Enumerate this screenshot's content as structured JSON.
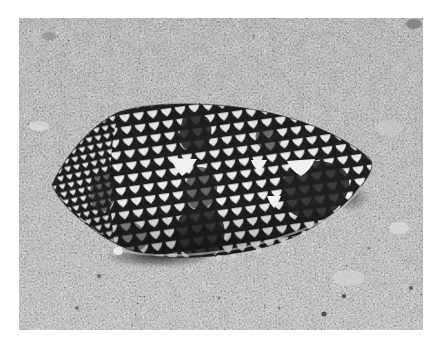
{
  "image": {
    "subject": "cone-shell-on-sand",
    "description": "Grayscale photograph of a textile cone shell with a net-like tent pattern and dark blotches resting on sandy sea floor",
    "border_color": "#ffffff",
    "colors": {
      "sand_dark": "#a9a9a9",
      "sand_mid": "#bdbdbd",
      "sand_light": "#d6d6d6",
      "shell_light": "#ececec",
      "shell_line": "#1e1e1e",
      "shell_blotch": "#262626",
      "shadow": "#2a2a2a"
    }
  }
}
